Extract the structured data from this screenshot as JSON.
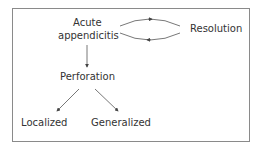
{
  "diagram": {
    "nodes": {
      "acute_line1": "Acute",
      "acute_line2": "appendicitis",
      "resolution": "Resolution",
      "perforation": "Perforation",
      "localized": "Localized",
      "generalized": "Generalized"
    },
    "edges": [
      {
        "from": "Acute appendicitis",
        "to": "Resolution",
        "type": "cycle-forward"
      },
      {
        "from": "Resolution",
        "to": "Acute appendicitis",
        "type": "cycle-back"
      },
      {
        "from": "Acute appendicitis",
        "to": "Perforation"
      },
      {
        "from": "Perforation",
        "to": "Localized"
      },
      {
        "from": "Perforation",
        "to": "Generalized"
      }
    ],
    "colors": {
      "line": "#444444",
      "border": "#8a8a8a",
      "text": "#333333"
    }
  }
}
